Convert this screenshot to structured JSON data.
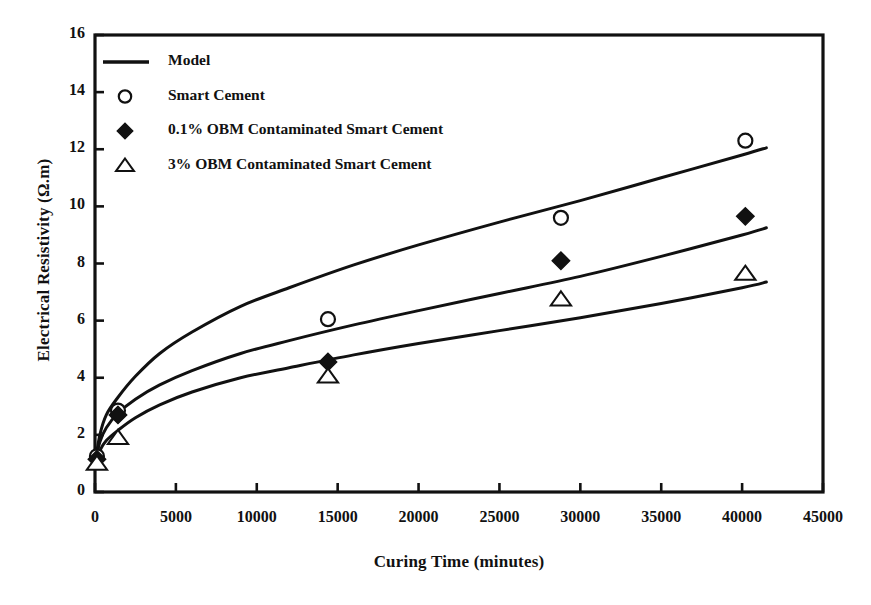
{
  "chart_data": {
    "type": "line",
    "title": "",
    "xlabel": "Curing Time (minutes)",
    "ylabel": "Electrical Resistivity (Ω.m)",
    "xlim": [
      0,
      45000
    ],
    "ylim": [
      0,
      16
    ],
    "xticks": [
      0,
      5000,
      10000,
      15000,
      20000,
      25000,
      30000,
      35000,
      40000,
      45000
    ],
    "yticks": [
      0,
      2,
      4,
      6,
      8,
      10,
      12,
      14,
      16
    ],
    "xtick_labels": [
      "0",
      "5000",
      "10000",
      "15000",
      "20000",
      "25000",
      "30000",
      "35000",
      "40000",
      "45000"
    ],
    "ytick_labels": [
      "0",
      "2",
      "4",
      "6",
      "8",
      "10",
      "12",
      "14",
      "16"
    ],
    "grid": false,
    "legend_position": "upper-left",
    "legend": [
      {
        "label": "Model",
        "marker": "line"
      },
      {
        "label": "Smart Cement",
        "marker": "open-circle"
      },
      {
        "label": "0.1% OBM Contaminated Smart Cement",
        "marker": "filled-diamond"
      },
      {
        "label": "3% OBM Contaminated Smart Cement",
        "marker": "open-triangle"
      }
    ],
    "series": [
      {
        "name": "Smart Cement",
        "marker": "open-circle",
        "points": [
          {
            "x": 120,
            "y": 1.25
          },
          {
            "x": 1420,
            "y": 2.85
          },
          {
            "x": 14400,
            "y": 6.05
          },
          {
            "x": 28800,
            "y": 9.6
          },
          {
            "x": 40200,
            "y": 12.3
          }
        ]
      },
      {
        "name": "0.1% OBM Contaminated Smart Cement",
        "marker": "filled-diamond",
        "points": [
          {
            "x": 120,
            "y": 1.15
          },
          {
            "x": 1420,
            "y": 2.7
          },
          {
            "x": 14400,
            "y": 4.55
          },
          {
            "x": 28800,
            "y": 8.1
          },
          {
            "x": 40200,
            "y": 9.65
          }
        ]
      },
      {
        "name": "3% OBM Contaminated Smart Cement",
        "marker": "open-triangle",
        "points": [
          {
            "x": 120,
            "y": 1.0
          },
          {
            "x": 1420,
            "y": 1.9
          },
          {
            "x": 14400,
            "y": 4.05
          },
          {
            "x": 28800,
            "y": 6.75
          },
          {
            "x": 40200,
            "y": 7.65
          }
        ]
      }
    ],
    "model_curves": [
      {
        "name": "Model - Smart Cement",
        "points": [
          {
            "x": 0,
            "y": 1.0
          },
          {
            "x": 300,
            "y": 2.0
          },
          {
            "x": 700,
            "y": 2.7
          },
          {
            "x": 1400,
            "y": 3.3
          },
          {
            "x": 2500,
            "y": 4.05
          },
          {
            "x": 4000,
            "y": 4.85
          },
          {
            "x": 6000,
            "y": 5.6
          },
          {
            "x": 9000,
            "y": 6.5
          },
          {
            "x": 12000,
            "y": 7.15
          },
          {
            "x": 16000,
            "y": 7.95
          },
          {
            "x": 20000,
            "y": 8.65
          },
          {
            "x": 25000,
            "y": 9.45
          },
          {
            "x": 30000,
            "y": 10.2
          },
          {
            "x": 35000,
            "y": 11.0
          },
          {
            "x": 40000,
            "y": 11.8
          },
          {
            "x": 41500,
            "y": 12.05
          }
        ]
      },
      {
        "name": "Model - 0.1% OBM",
        "points": [
          {
            "x": 0,
            "y": 1.0
          },
          {
            "x": 300,
            "y": 1.75
          },
          {
            "x": 700,
            "y": 2.25
          },
          {
            "x": 1400,
            "y": 2.75
          },
          {
            "x": 2500,
            "y": 3.25
          },
          {
            "x": 4000,
            "y": 3.75
          },
          {
            "x": 6000,
            "y": 4.25
          },
          {
            "x": 9000,
            "y": 4.85
          },
          {
            "x": 12000,
            "y": 5.3
          },
          {
            "x": 16000,
            "y": 5.85
          },
          {
            "x": 20000,
            "y": 6.35
          },
          {
            "x": 25000,
            "y": 6.95
          },
          {
            "x": 30000,
            "y": 7.55
          },
          {
            "x": 35000,
            "y": 8.25
          },
          {
            "x": 40000,
            "y": 9.0
          },
          {
            "x": 41500,
            "y": 9.25
          }
        ]
      },
      {
        "name": "Model - 3% OBM",
        "points": [
          {
            "x": 0,
            "y": 1.0
          },
          {
            "x": 300,
            "y": 1.45
          },
          {
            "x": 700,
            "y": 1.8
          },
          {
            "x": 1400,
            "y": 2.15
          },
          {
            "x": 2500,
            "y": 2.6
          },
          {
            "x": 4000,
            "y": 3.05
          },
          {
            "x": 6000,
            "y": 3.5
          },
          {
            "x": 9000,
            "y": 4.0
          },
          {
            "x": 12000,
            "y": 4.35
          },
          {
            "x": 16000,
            "y": 4.8
          },
          {
            "x": 20000,
            "y": 5.2
          },
          {
            "x": 25000,
            "y": 5.65
          },
          {
            "x": 30000,
            "y": 6.1
          },
          {
            "x": 35000,
            "y": 6.6
          },
          {
            "x": 40000,
            "y": 7.15
          },
          {
            "x": 41500,
            "y": 7.35
          }
        ]
      }
    ]
  }
}
